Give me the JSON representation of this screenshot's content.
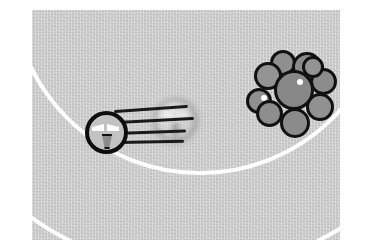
{
  "figure": {
    "title": "Alpha particle deflected by an atomic nucleus",
    "caption": "",
    "panel": {
      "background_color": "#c9c9c9",
      "texture": "halftone-weave",
      "border_color": "#ffffff"
    }
  },
  "elements": {
    "particle": {
      "name": "alpha-particle-character",
      "label": "",
      "face_expression": "angry",
      "body_color": "#c2c2c2",
      "outline_color": "#0d0d0d",
      "eye_color": "#ffffff",
      "mouth_color": "#8a8a8a"
    },
    "ghost": {
      "name": "motion-blur-afterimage",
      "label": "",
      "opacity": "0.85"
    },
    "speed_lines": {
      "name": "motion-speed-lines",
      "count": 4,
      "color": "#1a1a1a",
      "lines": [
        {
          "x": 0,
          "y": 2,
          "length": 74,
          "angle": 4
        },
        {
          "x": 2,
          "y": 13,
          "length": 78,
          "angle": 3
        },
        {
          "x": 0,
          "y": 24,
          "length": 72,
          "angle": 2
        },
        {
          "x": 4,
          "y": 33,
          "length": 66,
          "angle": 1
        }
      ]
    },
    "nucleus": {
      "name": "atomic-nucleus-cluster",
      "label": "",
      "sphere_color": "#8f8f8f",
      "outline_color": "#111111",
      "highlight_color": "#ffffff",
      "spheres": [
        {
          "x": 26,
          "y": 2,
          "d": 26,
          "shade": "#8f8f8f",
          "highlight": false
        },
        {
          "x": 48,
          "y": 4,
          "d": 30,
          "shade": "#8a8a8a",
          "highlight": true
        },
        {
          "x": 10,
          "y": 14,
          "d": 28,
          "shade": "#939393",
          "highlight": false
        },
        {
          "x": 66,
          "y": 20,
          "d": 27,
          "shade": "#8c8c8c",
          "highlight": false
        },
        {
          "x": 2,
          "y": 40,
          "d": 26,
          "shade": "#8f8f8f",
          "highlight": true
        },
        {
          "x": 30,
          "y": 22,
          "d": 40,
          "shade": "#878787",
          "highlight": true
        },
        {
          "x": 62,
          "y": 45,
          "d": 28,
          "shade": "#919191",
          "highlight": false
        },
        {
          "x": 12,
          "y": 52,
          "d": 27,
          "shade": "#8d8d8d",
          "highlight": false
        },
        {
          "x": 36,
          "y": 60,
          "d": 30,
          "shade": "#8b8b8b",
          "highlight": false
        },
        {
          "x": 58,
          "y": 8,
          "d": 22,
          "shade": "#949494",
          "highlight": false
        }
      ]
    },
    "orbits": [
      {
        "name": "inner-orbit-arc",
        "stroke": "#ffffff",
        "width_px": 4
      },
      {
        "name": "outer-orbit-arc",
        "stroke": "#ffffff",
        "width_px": 4
      }
    ]
  },
  "colors": {
    "panel_gray": "#c9c9c9",
    "orbit_white": "#ffffff",
    "ink_black": "#0d0d0d",
    "sphere_gray": "#8f8f8f",
    "page_white": "#ffffff"
  }
}
